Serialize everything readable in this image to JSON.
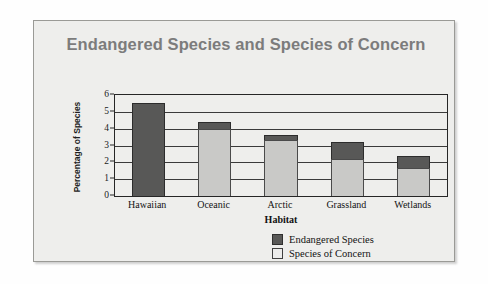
{
  "card": {
    "background_color": "#eeeeec",
    "border_color": "#9a9a96"
  },
  "chart_data": {
    "type": "bar",
    "subtype": "stacked",
    "title": "Endangered Species and Species of Concern",
    "xlabel": "Habitat",
    "ylabel": "Percentage of Species",
    "categories": [
      "Hawaiian",
      "Oceanic",
      "Arctic",
      "Grassland",
      "Wetlands"
    ],
    "series": [
      {
        "name": "Species of Concern",
        "color": "#c9c9c7",
        "values": [
          0,
          4.0,
          3.3,
          2.2,
          1.65
        ]
      },
      {
        "name": "Endangered Species",
        "color": "#585857",
        "values": [
          5.5,
          0.4,
          0.3,
          1.0,
          0.7
        ]
      }
    ],
    "totals": [
      5.5,
      4.4,
      3.6,
      3.2,
      2.35
    ],
    "ylim": [
      0,
      6
    ],
    "yticks": [
      0,
      1,
      2,
      3,
      4,
      5,
      6
    ],
    "ytick_labels": [
      "0",
      "1",
      "2",
      "3",
      "4",
      "5",
      "6"
    ],
    "grid": true,
    "grid_axis": "y",
    "legend_position": "bottom-right",
    "legend": [
      "Endangered Species",
      "Species of Concern"
    ]
  }
}
